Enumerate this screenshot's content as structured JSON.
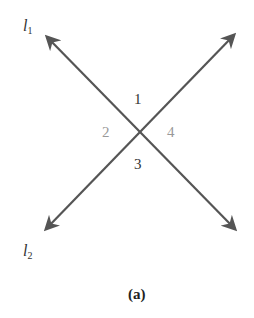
{
  "diagram": {
    "lines": [
      {
        "name": "l",
        "subscript": "1",
        "from": [
          235,
          229
        ],
        "to": [
          47,
          37
        ]
      },
      {
        "name": "l",
        "subscript": "2",
        "from": [
          234,
          35
        ],
        "to": [
          46,
          229
        ]
      }
    ],
    "intersection": [
      140,
      132
    ],
    "angles": {
      "top": "1",
      "left": "2",
      "bottom": "3",
      "right": "4"
    },
    "caption": "(a)",
    "colors": {
      "line": "#555555",
      "label_dark": "#333333",
      "label_light": "#999999"
    }
  }
}
